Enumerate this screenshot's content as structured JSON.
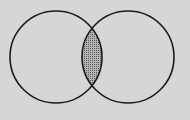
{
  "diagram": {
    "type": "venn",
    "sets": [
      {
        "name": "A",
        "cx": 56,
        "cy": 57,
        "r": 46
      },
      {
        "name": "B",
        "cx": 128,
        "cy": 57,
        "r": 46
      }
    ],
    "shaded_region": "A ∩ B",
    "colors": {
      "background": "#d6d6d6",
      "stroke": "#1a1a1a",
      "shade": "#8a8a8a"
    }
  }
}
